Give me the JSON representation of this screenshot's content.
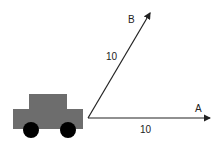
{
  "diagram": {
    "title": "",
    "colors": {
      "car_body": "#6d6d6d",
      "wheel": "#000000",
      "vector": "#222222",
      "background": "#ffffff"
    },
    "car": {
      "icon": "car-icon"
    },
    "vectors": [
      {
        "name": "A",
        "label": "A",
        "magnitude": "10",
        "direction": "horizontal"
      },
      {
        "name": "B",
        "label": "B",
        "magnitude": "10",
        "direction": "diagonal-up-right"
      }
    ]
  }
}
